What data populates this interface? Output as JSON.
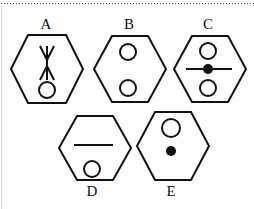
{
  "figure": {
    "background_color": "#fdfdfd",
    "stroke_color": "#111111",
    "top_rule": "dotted-rule",
    "left_edge": "page-edge-line"
  },
  "options": [
    {
      "id": "A",
      "label": "A",
      "label_position": "above",
      "shape": "hexagon",
      "contents": [
        {
          "kind": "double-headed-arrow",
          "orientation": "vertical",
          "position": "center"
        },
        {
          "kind": "open-circle",
          "position": "bottom-center"
        }
      ]
    },
    {
      "id": "B",
      "label": "B",
      "label_position": "above",
      "shape": "hexagon",
      "contents": [
        {
          "kind": "open-circle",
          "position": "upper-left-of-center"
        },
        {
          "kind": "open-circle",
          "position": "lower-left-of-center"
        }
      ]
    },
    {
      "id": "C",
      "label": "C",
      "label_position": "above",
      "shape": "hexagon",
      "contents": [
        {
          "kind": "open-circle",
          "position": "top-center"
        },
        {
          "kind": "horizontal-line-with-filled-dot",
          "position": "middle"
        },
        {
          "kind": "open-circle",
          "position": "bottom-center"
        }
      ]
    },
    {
      "id": "D",
      "label": "D",
      "label_position": "below",
      "shape": "hexagon",
      "contents": [
        {
          "kind": "horizontal-line",
          "position": "upper-middle"
        },
        {
          "kind": "open-circle",
          "position": "bottom-center"
        }
      ]
    },
    {
      "id": "E",
      "label": "E",
      "label_position": "below",
      "shape": "hexagon",
      "contents": [
        {
          "kind": "open-circle",
          "position": "top-center"
        },
        {
          "kind": "filled-dot",
          "position": "middle"
        }
      ]
    }
  ]
}
